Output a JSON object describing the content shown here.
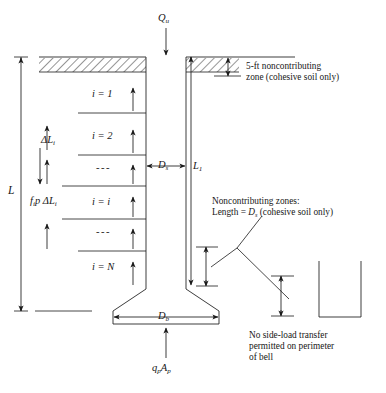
{
  "figure": {
    "top_load": {
      "symbol": "Q",
      "subscript": "u",
      "name": "ultimate-axial-load"
    },
    "base_load": {
      "symbol": "q",
      "subscript": "p",
      "symbol2": "A",
      "subscript2": "p",
      "name": "base-bearing-load"
    },
    "side_load": {
      "symbol": "f",
      "subscript": "i",
      "symbol2": "p",
      "symbol3": "ΔL",
      "subscript3": "i",
      "name": "side-shear-load"
    },
    "total_length": {
      "symbol": "L",
      "name": "total-shaft-length"
    },
    "embedded_length": {
      "symbol": "L",
      "subscript": "1",
      "name": "contributing-length"
    },
    "shaft_diameter": {
      "symbol": "D",
      "subscript": "s",
      "name": "shaft-diameter"
    },
    "bell_diameter": {
      "symbol": "D",
      "subscript": "b",
      "name": "bell-diameter"
    },
    "increment": {
      "symbol": "ΔL",
      "subscript": "i",
      "name": "segment-thickness"
    },
    "segments": [
      {
        "label": "i = 1",
        "prefix": "i = ",
        "value": "1"
      },
      {
        "label": "i = 2",
        "prefix": "i = ",
        "value": "2"
      },
      {
        "label": "---",
        "prefix": "",
        "value": "---"
      },
      {
        "label": "i = i",
        "prefix": "i = ",
        "value": "i"
      },
      {
        "label": "---",
        "prefix": "",
        "value": "---"
      },
      {
        "label": "i = N",
        "prefix": "i = ",
        "value": "N"
      }
    ],
    "annotations": {
      "top_zone": {
        "line1": "5-ft noncontributing",
        "line2": "zone (cohesive soil only)",
        "name": "five-ft-noncontributing-zone-note"
      },
      "noncontributing_zones": {
        "line1": "Noncontributing zones:",
        "line2_pre": "Length = ",
        "line2_sym": "D",
        "line2_sub": "s",
        "line2_post": " (cohesive soil only)",
        "name": "noncontributing-zones-note"
      },
      "bell_note": {
        "line1": "No side-load transfer",
        "line2": "permitted on perimeter",
        "line3": "of bell",
        "name": "no-side-load-transfer-note"
      }
    },
    "caption": "",
    "colors": {
      "ink": "#171717",
      "line": "#1a1a1a",
      "hatch": "#333333",
      "background": "#ffffff"
    }
  }
}
